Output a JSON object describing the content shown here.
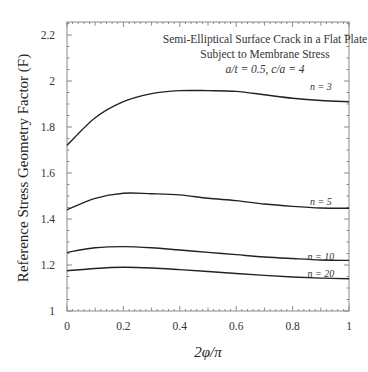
{
  "chart_data": {
    "type": "line",
    "title": [
      "Semi-Elliptical Surface Crack in a Flat Plate",
      "Subject to Membrane Stress",
      "a/t = 0.5,  c/a = 4"
    ],
    "xlabel": "2φ/π",
    "ylabel": "Reference Stress Geometry Factor (F)",
    "xlim": [
      0,
      1
    ],
    "ylim": [
      1,
      2.25
    ],
    "xticks": [
      0,
      0.2,
      0.4,
      0.6,
      0.8,
      1
    ],
    "xtick_labels": [
      "0",
      "0.2",
      "0.4",
      "0.6",
      "0.8",
      "1"
    ],
    "yticks": [
      1,
      1.2,
      1.4,
      1.6,
      1.8,
      2,
      2.2
    ],
    "ytick_labels": [
      "1",
      "1.2",
      "1.4",
      "1.6",
      "1.8",
      "2",
      "2.2"
    ],
    "grid": false,
    "legend": "inline labels at right",
    "x": [
      0,
      0.1,
      0.2,
      0.3,
      0.4,
      0.5,
      0.6,
      0.7,
      0.8,
      0.9,
      1.0
    ],
    "series": [
      {
        "name": "n = 3",
        "label_x": 0.9,
        "label_y": 1.975,
        "values": [
          1.72,
          1.84,
          1.91,
          1.945,
          1.958,
          1.958,
          1.955,
          1.94,
          1.925,
          1.915,
          1.91
        ]
      },
      {
        "name": "n = 5",
        "label_x": 0.9,
        "label_y": 1.475,
        "values": [
          1.44,
          1.49,
          1.512,
          1.51,
          1.505,
          1.49,
          1.48,
          1.465,
          1.455,
          1.448,
          1.447
        ]
      },
      {
        "name": "n = 10",
        "label_x": 0.9,
        "label_y": 1.235,
        "values": [
          1.255,
          1.275,
          1.28,
          1.275,
          1.265,
          1.255,
          1.245,
          1.235,
          1.228,
          1.222,
          1.22
        ]
      },
      {
        "name": "n = 20",
        "label_x": 0.9,
        "label_y": 1.16,
        "values": [
          1.175,
          1.185,
          1.19,
          1.187,
          1.18,
          1.172,
          1.163,
          1.155,
          1.148,
          1.143,
          1.14
        ]
      }
    ]
  }
}
